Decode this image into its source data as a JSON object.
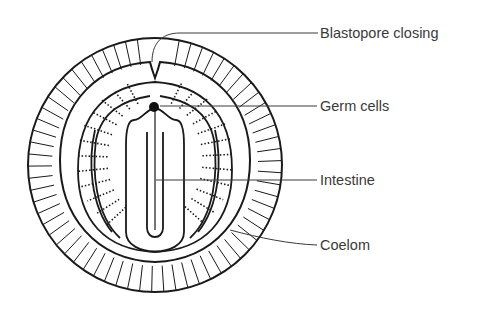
{
  "figure": {
    "type": "anatomical cross-section diagram",
    "line_color": "#1a1a1a",
    "label_color": "#3a3a3a",
    "background": "#ffffff"
  },
  "labels": [
    {
      "id": "blastopore",
      "text": "Blastopore closing"
    },
    {
      "id": "germ_cells",
      "text": "Germ cells"
    },
    {
      "id": "intestine",
      "text": "Intestine"
    },
    {
      "id": "coelom",
      "text": "Coelom"
    }
  ]
}
